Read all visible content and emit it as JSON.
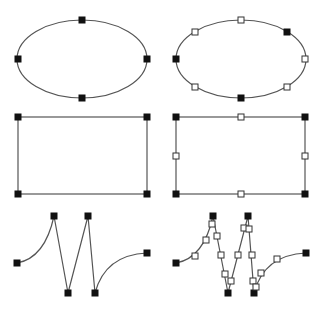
{
  "colors": {
    "background": "#ffffff",
    "stroke": "#555555",
    "handle_filled": "#111111",
    "handle_open_fill": "#ffffff",
    "handle_open_stroke": "#333333"
  },
  "handle_size": 6,
  "panels": [
    {
      "id": "ellipse-anchors",
      "type": "ellipse",
      "geometry": {
        "cx": 82,
        "cy": 59,
        "rx": 65,
        "ry": 39
      },
      "handles": [
        {
          "x": 18,
          "y": 59,
          "style": "filled"
        },
        {
          "x": 147,
          "y": 59,
          "style": "filled"
        },
        {
          "x": 82,
          "y": 20,
          "style": "filled"
        },
        {
          "x": 82,
          "y": 98,
          "style": "filled"
        }
      ]
    },
    {
      "id": "ellipse-subdivided",
      "type": "ellipse",
      "geometry": {
        "cx": 241,
        "cy": 59,
        "rx": 65,
        "ry": 39
      },
      "handles": [
        {
          "x": 176,
          "y": 59,
          "style": "filled"
        },
        {
          "x": 287,
          "y": 32,
          "style": "filled"
        },
        {
          "x": 241,
          "y": 98,
          "style": "filled"
        },
        {
          "x": 241,
          "y": 20,
          "style": "open"
        },
        {
          "x": 195,
          "y": 32,
          "style": "open"
        },
        {
          "x": 305,
          "y": 59,
          "style": "open"
        },
        {
          "x": 195,
          "y": 87,
          "style": "open"
        },
        {
          "x": 287,
          "y": 87,
          "style": "open"
        }
      ]
    },
    {
      "id": "rect-anchors",
      "type": "rect",
      "geometry": {
        "x": 18,
        "y": 117,
        "w": 129,
        "h": 77
      },
      "handles": [
        {
          "x": 18,
          "y": 117,
          "style": "filled"
        },
        {
          "x": 147,
          "y": 117,
          "style": "filled"
        },
        {
          "x": 18,
          "y": 194,
          "style": "filled"
        },
        {
          "x": 147,
          "y": 194,
          "style": "filled"
        }
      ]
    },
    {
      "id": "rect-subdivided",
      "type": "rect",
      "geometry": {
        "x": 176,
        "y": 117,
        "w": 129,
        "h": 77
      },
      "handles": [
        {
          "x": 176,
          "y": 117,
          "style": "filled"
        },
        {
          "x": 305,
          "y": 117,
          "style": "filled"
        },
        {
          "x": 176,
          "y": 194,
          "style": "filled"
        },
        {
          "x": 305,
          "y": 194,
          "style": "filled"
        },
        {
          "x": 241,
          "y": 117,
          "style": "open"
        },
        {
          "x": 241,
          "y": 194,
          "style": "open"
        },
        {
          "x": 176,
          "y": 156,
          "style": "open"
        },
        {
          "x": 305,
          "y": 156,
          "style": "open"
        }
      ]
    },
    {
      "id": "path-anchors",
      "type": "path",
      "geometry": {
        "d": "M17,263 Q45,258 54,216 L68,293 L88,216 L95,293 Q105,255 147,253"
      },
      "handles": [
        {
          "x": 17,
          "y": 263,
          "style": "filled"
        },
        {
          "x": 54,
          "y": 216,
          "style": "filled"
        },
        {
          "x": 68,
          "y": 293,
          "style": "filled"
        },
        {
          "x": 88,
          "y": 216,
          "style": "filled"
        },
        {
          "x": 95,
          "y": 293,
          "style": "filled"
        },
        {
          "x": 147,
          "y": 253,
          "style": "filled"
        }
      ]
    },
    {
      "id": "path-subdivided",
      "type": "path",
      "geometry": {
        "d": "M176,263 Q204,258 213,216 L228,293 L248,216 L254,293 Q264,255 306,253"
      },
      "handles": [
        {
          "x": 176,
          "y": 263,
          "style": "filled"
        },
        {
          "x": 213,
          "y": 216,
          "style": "filled"
        },
        {
          "x": 228,
          "y": 293,
          "style": "filled"
        },
        {
          "x": 248,
          "y": 216,
          "style": "filled"
        },
        {
          "x": 254,
          "y": 293,
          "style": "filled"
        },
        {
          "x": 306,
          "y": 253,
          "style": "filled"
        },
        {
          "x": 195,
          "y": 256,
          "style": "open"
        },
        {
          "x": 206,
          "y": 240,
          "style": "open"
        },
        {
          "x": 212,
          "y": 224,
          "style": "open"
        },
        {
          "x": 217,
          "y": 236,
          "style": "open"
        },
        {
          "x": 221,
          "y": 255,
          "style": "open"
        },
        {
          "x": 225,
          "y": 274,
          "style": "open"
        },
        {
          "x": 231,
          "y": 281,
          "style": "open"
        },
        {
          "x": 238,
          "y": 255,
          "style": "open"
        },
        {
          "x": 244,
          "y": 228,
          "style": "open"
        },
        {
          "x": 249,
          "y": 229,
          "style": "open"
        },
        {
          "x": 252,
          "y": 255,
          "style": "open"
        },
        {
          "x": 253,
          "y": 281,
          "style": "open"
        },
        {
          "x": 256,
          "y": 287,
          "style": "open"
        },
        {
          "x": 261,
          "y": 273,
          "style": "open"
        },
        {
          "x": 277,
          "y": 259,
          "style": "open"
        }
      ]
    }
  ]
}
